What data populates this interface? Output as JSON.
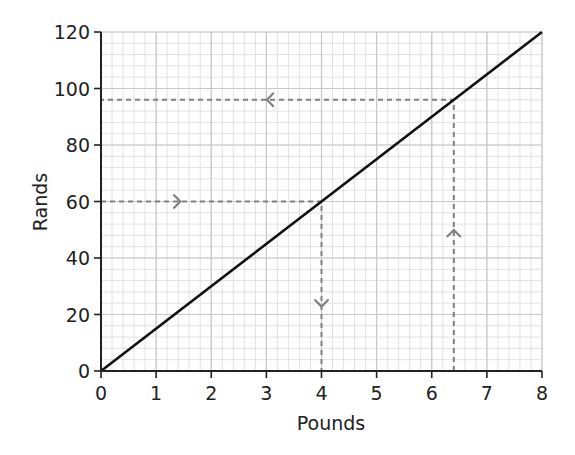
{
  "chart_data": {
    "type": "line",
    "title": "",
    "xlabel": "Pounds",
    "ylabel": "Rands",
    "xlim": [
      0,
      8
    ],
    "ylim": [
      0,
      120
    ],
    "x_ticks": [
      0,
      1,
      2,
      3,
      4,
      5,
      6,
      7,
      8
    ],
    "y_ticks": [
      0,
      20,
      40,
      60,
      80,
      100,
      120
    ],
    "grid": {
      "on": true,
      "major_x": 1,
      "major_y": 20,
      "minor_x": 0.2,
      "minor_y": 4
    },
    "legend": null,
    "series": [
      {
        "name": "conversion",
        "x": [
          0,
          8
        ],
        "y": [
          0,
          120
        ],
        "color": "#111111",
        "style": "solid"
      }
    ],
    "annotations": [
      {
        "type": "dashed-path",
        "description": "Read 60 rands across to line then down to pounds",
        "points": [
          [
            0,
            60
          ],
          [
            4,
            60
          ],
          [
            4,
            0
          ]
        ],
        "arrows": [
          "right",
          "down"
        ],
        "color": "#808080"
      },
      {
        "type": "dashed-path",
        "description": "Read 6.4 pounds up to line then across to rands",
        "points": [
          [
            6.4,
            0
          ],
          [
            6.4,
            96
          ],
          [
            0,
            96
          ]
        ],
        "arrows": [
          "up",
          "left"
        ],
        "color": "#808080"
      }
    ]
  },
  "labels": {
    "xlabel": "Pounds",
    "ylabel": "Rands",
    "x_ticks": [
      "0",
      "1",
      "2",
      "3",
      "4",
      "5",
      "6",
      "7",
      "8"
    ],
    "y_ticks": [
      "0",
      "20",
      "40",
      "60",
      "80",
      "100",
      "120"
    ]
  },
  "colors": {
    "axis": "#222222",
    "line": "#111111",
    "grid_major": "#c8c8c8",
    "grid_minor": "#e2e2e2",
    "dashed": "#808080"
  }
}
